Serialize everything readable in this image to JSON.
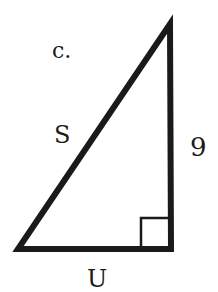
{
  "diagram": {
    "problem_label": "c.",
    "type": "right-triangle",
    "sides": {
      "hypotenuse": "S",
      "vertical_leg": "9",
      "horizontal_leg": "U"
    },
    "right_angle_marker": "bottom-right",
    "stroke_color": "#1a1a1a",
    "background": "#ffffff"
  }
}
